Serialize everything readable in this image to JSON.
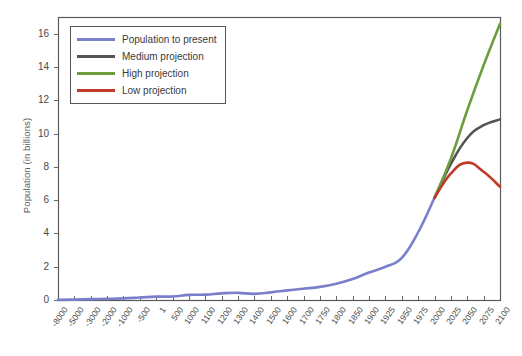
{
  "chart_data": {
    "type": "line",
    "title": "",
    "xlabel": "",
    "ylabel": "Population (in billions)",
    "ylim": [
      0,
      17
    ],
    "yticks": [
      0,
      2,
      4,
      6,
      8,
      10,
      12,
      14,
      16
    ],
    "grid": false,
    "legend_position": "top-left",
    "categories": [
      "-8000",
      "-5000",
      "-3000",
      "-2000",
      "-1000",
      "-500",
      "1",
      "500",
      "1000",
      "1100",
      "1200",
      "1300",
      "1400",
      "1500",
      "1600",
      "1700",
      "1750",
      "1800",
      "1850",
      "1900",
      "1925",
      "1950",
      "1975",
      "2000",
      "2025",
      "2050",
      "2075",
      "2100"
    ],
    "series": [
      {
        "name": "Population to present",
        "color": "#7a7fcc",
        "values": [
          0.005,
          0.02,
          0.05,
          0.07,
          0.1,
          0.15,
          0.2,
          0.21,
          0.31,
          0.32,
          0.4,
          0.43,
          0.37,
          0.46,
          0.58,
          0.68,
          0.79,
          0.98,
          1.26,
          1.65,
          2.0,
          2.53,
          4.07,
          6.14,
          null,
          null,
          null,
          null
        ]
      },
      {
        "name": "Medium projection",
        "color": "#545454",
        "values": [
          null,
          null,
          null,
          null,
          null,
          null,
          null,
          null,
          null,
          null,
          null,
          null,
          null,
          null,
          null,
          null,
          null,
          null,
          null,
          null,
          null,
          null,
          null,
          6.14,
          8.18,
          9.73,
          10.5,
          10.85
        ]
      },
      {
        "name": "High projection",
        "color": "#6d9e3e",
        "values": [
          null,
          null,
          null,
          null,
          null,
          null,
          null,
          null,
          null,
          null,
          null,
          null,
          null,
          null,
          null,
          null,
          null,
          null,
          null,
          null,
          null,
          null,
          null,
          6.14,
          8.5,
          11.4,
          14.1,
          16.6
        ]
      },
      {
        "name": "Low projection",
        "color": "#c0392b",
        "values": [
          null,
          null,
          null,
          null,
          null,
          null,
          null,
          null,
          null,
          null,
          null,
          null,
          null,
          null,
          null,
          null,
          null,
          null,
          null,
          null,
          null,
          null,
          null,
          6.14,
          7.6,
          8.25,
          7.7,
          6.8
        ]
      }
    ]
  },
  "legend": {
    "items": [
      {
        "label": "Population to present",
        "color": "#7a7fcc"
      },
      {
        "label": "Medium projection",
        "color": "#545454"
      },
      {
        "label": "High projection",
        "color": "#6d9e3e"
      },
      {
        "label": "Low projection",
        "color": "#c0392b"
      }
    ]
  },
  "axis": {
    "y_title": "Population (in billions)",
    "y_ticks": [
      "0",
      "2",
      "4",
      "6",
      "8",
      "10",
      "12",
      "14",
      "16"
    ],
    "x_ticks": [
      "-8000",
      "-5000",
      "-3000",
      "-2000",
      "-1000",
      "-500",
      "1",
      "500",
      "1000",
      "1100",
      "1200",
      "1300",
      "1400",
      "1500",
      "1600",
      "1700",
      "1750",
      "1800",
      "1850",
      "1900",
      "1925",
      "1950",
      "1975",
      "2000",
      "2025",
      "2050",
      "2075",
      "2100"
    ]
  },
  "colors": {
    "population": "#7a7fcc",
    "medium": "#545454",
    "high": "#6d9e3e",
    "low": "#c0392b",
    "axis": "#5a5a5a",
    "background": "#ffffff"
  }
}
